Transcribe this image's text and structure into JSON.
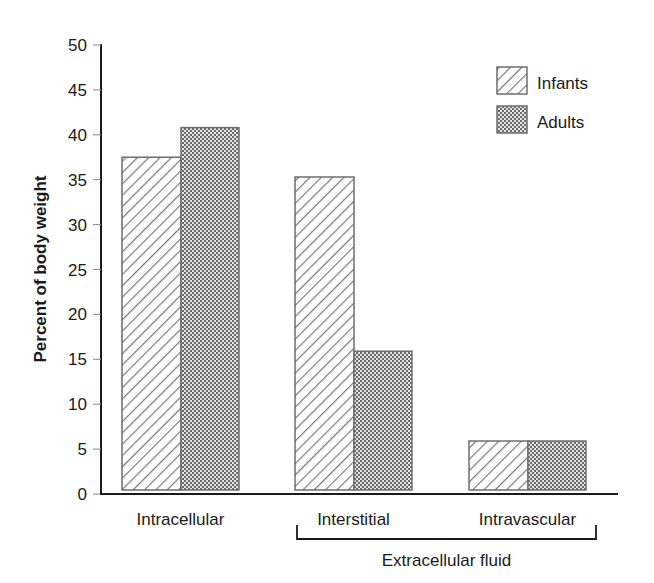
{
  "chart_data": {
    "type": "bar",
    "title": "",
    "xlabel": "",
    "ylabel": "Percent of body weight",
    "ylim": [
      0,
      50
    ],
    "yticks": [
      0,
      5,
      10,
      15,
      20,
      25,
      30,
      35,
      40,
      45,
      50
    ],
    "categories": [
      "Intracellular",
      "Interstitial",
      "Intravascular"
    ],
    "series": [
      {
        "name": "Infants",
        "pattern": "diagonal-hatch",
        "values": [
          37.5,
          35.3,
          5.9
        ]
      },
      {
        "name": "Adults",
        "pattern": "dotted-crosshatch",
        "values": [
          40.8,
          15.9,
          5.9
        ]
      }
    ],
    "group_annotation": {
      "label": "Extracellular fluid",
      "spans": [
        "Interstitial",
        "Intravascular"
      ]
    },
    "legend": {
      "position": "upper-right",
      "entries": [
        "Infants",
        "Adults"
      ]
    },
    "grid": false
  },
  "colors": {
    "axis": "#1a1a1a",
    "bar_outline": "#6e6e6e",
    "hatch": "#7a7a7a",
    "dots": "#6a6a6a"
  }
}
